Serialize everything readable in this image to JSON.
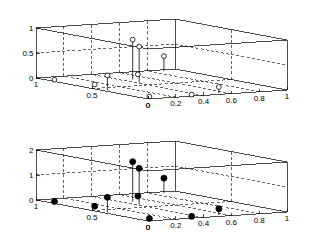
{
  "figure": {
    "title": "",
    "background": "#ffffff",
    "panels": 2
  },
  "chart_data": [
    {
      "id": "top-stem-plot",
      "type": "scatter",
      "subtype": "stem3",
      "title": "",
      "xlabel": "",
      "ylabel": "",
      "zlabel": "",
      "marker": "open-circle",
      "marker_color": "#ffffff",
      "marker_edge_color": "#000000",
      "stem_color": "#000000",
      "grid": true,
      "box": true,
      "xlim": [
        0,
        1
      ],
      "ylim": [
        0,
        1
      ],
      "zlim": [
        0,
        1
      ],
      "xticks": [
        0,
        0.2,
        0.4,
        0.6,
        0.8,
        1
      ],
      "xticklabels": [
        "0",
        "0.2",
        "0.4",
        "0.6",
        "0.8",
        "1"
      ],
      "yticks": [
        0,
        0.5,
        1
      ],
      "yticklabels": [
        "0",
        "0.5",
        "1"
      ],
      "zticks": [
        0,
        0.5,
        1
      ],
      "zticklabels": [
        "0",
        "0.5",
        "1"
      ],
      "points": [
        {
          "x": 0.02,
          "y": 0.86,
          "z": 0.02
        },
        {
          "x": 0.03,
          "y": 0.4,
          "z": 0.3
        },
        {
          "x": 0.05,
          "y": 0.05,
          "z": 0.02
        },
        {
          "x": 0.1,
          "y": 0.6,
          "z": 0.02
        },
        {
          "x": 0.33,
          "y": 0.02,
          "z": 0.02
        },
        {
          "x": 0.42,
          "y": 0.6,
          "z": 0.72
        },
        {
          "x": 0.47,
          "y": 0.72,
          "z": 0.8
        },
        {
          "x": 0.55,
          "y": 0.05,
          "z": 0.12
        },
        {
          "x": 0.62,
          "y": 0.86,
          "z": 0.02
        },
        {
          "x": 0.88,
          "y": 0.95,
          "z": 0.3
        }
      ]
    },
    {
      "id": "bottom-stem-plot",
      "type": "scatter",
      "subtype": "stem3",
      "title": "",
      "xlabel": "",
      "ylabel": "",
      "zlabel": "",
      "marker": "filled-circle",
      "marker_color": "#000000",
      "marker_edge_color": "#000000",
      "stem_color": "#000000",
      "grid": true,
      "box": true,
      "xlim": [
        0,
        1
      ],
      "ylim": [
        0,
        1
      ],
      "zlim": [
        0,
        2
      ],
      "xticks": [
        0,
        0.2,
        0.4,
        0.6,
        0.8,
        1
      ],
      "xticklabels": [
        "0",
        "0.2",
        "0.4",
        "0.6",
        "0.8",
        "1"
      ],
      "yticks": [
        0,
        0.5,
        1
      ],
      "yticklabels": [
        "0",
        "0.5",
        "1"
      ],
      "zticks": [
        0,
        1,
        2
      ],
      "zticklabels": [
        "0",
        "1",
        "2"
      ],
      "points": [
        {
          "x": 0.02,
          "y": 0.86,
          "z": 0.05
        },
        {
          "x": 0.03,
          "y": 0.4,
          "z": 0.6
        },
        {
          "x": 0.05,
          "y": 0.05,
          "z": 0.04
        },
        {
          "x": 0.1,
          "y": 0.6,
          "z": 0.05
        },
        {
          "x": 0.33,
          "y": 0.02,
          "z": 0.05
        },
        {
          "x": 0.42,
          "y": 0.6,
          "z": 1.45
        },
        {
          "x": 0.47,
          "y": 0.72,
          "z": 1.6
        },
        {
          "x": 0.55,
          "y": 0.05,
          "z": 0.25
        },
        {
          "x": 0.62,
          "y": 0.86,
          "z": 0.05
        },
        {
          "x": 0.88,
          "y": 0.95,
          "z": 0.6
        }
      ]
    }
  ]
}
